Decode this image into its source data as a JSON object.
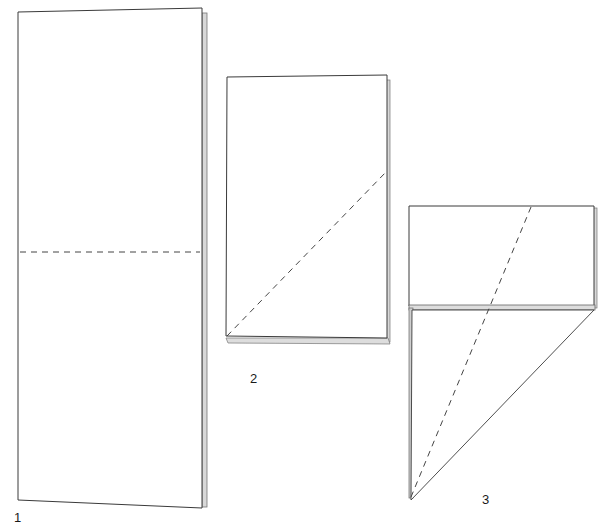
{
  "colors": {
    "line": "#3a3a3a",
    "edge": "#9a9a9a",
    "dash": "#444444",
    "paper": "#ffffff"
  },
  "steps": [
    {
      "label": "1",
      "description": "Tall rectangle with horizontal dashed fold line at the middle"
    },
    {
      "label": "2",
      "description": "Folded rectangle with diagonal dashed fold line from bottom-left corner to right edge"
    },
    {
      "label": "3",
      "description": "Rectangle with folded triangular flap below; dashed diagonal fold line"
    }
  ]
}
